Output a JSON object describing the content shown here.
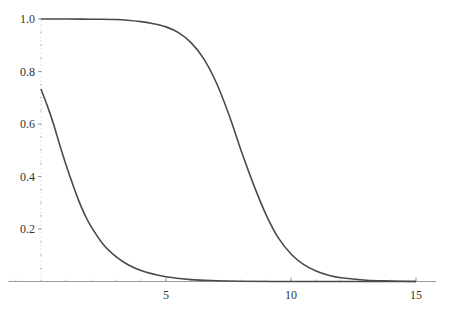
{
  "chart_data": {
    "type": "line",
    "title": "",
    "xlabel": "",
    "ylabel": "",
    "xlim": [
      -1.3,
      15.8
    ],
    "ylim": [
      0,
      1.0
    ],
    "grid": false,
    "legend": null,
    "x_ticks": [
      5,
      10,
      15
    ],
    "x_tick_labels": [
      "5",
      "10",
      "15"
    ],
    "y_ticks": [
      0.2,
      0.4,
      0.6,
      0.8,
      1.0
    ],
    "y_tick_labels": [
      "0.2",
      "0.4",
      "0.6",
      "0.8",
      "1.0"
    ],
    "x_minor_step": 1,
    "y_minor_step": 0.05,
    "series": [
      {
        "name": "upper curve",
        "color": "#4a4a4a",
        "x": [
          0,
          1,
          2,
          3,
          4,
          4.5,
          5,
          5.5,
          6,
          6.5,
          7,
          7.5,
          8,
          8.5,
          9,
          9.5,
          10,
          10.5,
          11,
          11.5,
          12,
          13,
          14,
          15
        ],
        "y": [
          1.0,
          1.0,
          0.999,
          0.998,
          0.99,
          0.982,
          0.97,
          0.948,
          0.91,
          0.85,
          0.76,
          0.64,
          0.5,
          0.37,
          0.255,
          0.165,
          0.105,
          0.065,
          0.04,
          0.024,
          0.014,
          0.005,
          0.002,
          0.0
        ]
      },
      {
        "name": "lower curve",
        "color": "#4a4a4a",
        "x": [
          0,
          0.25,
          0.5,
          0.75,
          1,
          1.25,
          1.5,
          1.75,
          2,
          2.5,
          3,
          3.5,
          4,
          4.5,
          5,
          6,
          7,
          8,
          10,
          12,
          15
        ],
        "y": [
          0.733,
          0.67,
          0.6,
          0.52,
          0.445,
          0.375,
          0.31,
          0.255,
          0.21,
          0.14,
          0.095,
          0.063,
          0.042,
          0.028,
          0.018,
          0.007,
          0.003,
          0.001,
          0.0,
          0.0,
          0.0
        ]
      }
    ]
  }
}
